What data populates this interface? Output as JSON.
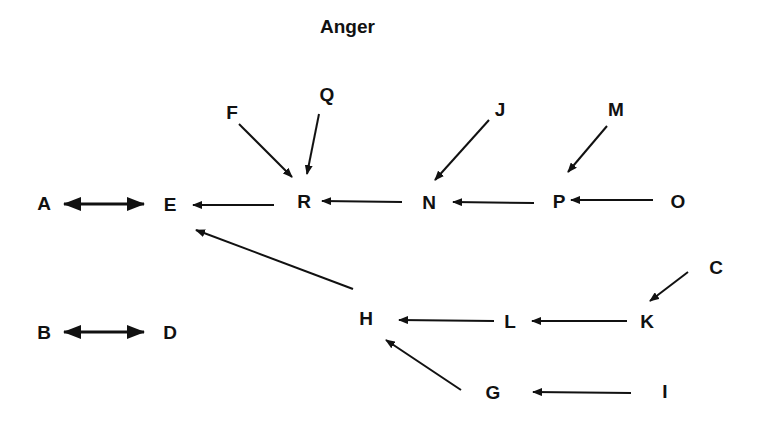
{
  "diagram": {
    "title": "Anger",
    "nodes": [
      {
        "id": "A",
        "label": "A",
        "x": 44,
        "y": 203
      },
      {
        "id": "E",
        "label": "E",
        "x": 170,
        "y": 204
      },
      {
        "id": "F",
        "label": "F",
        "x": 232,
        "y": 112
      },
      {
        "id": "Q",
        "label": "Q",
        "x": 327,
        "y": 94
      },
      {
        "id": "R",
        "label": "R",
        "x": 304,
        "y": 201
      },
      {
        "id": "J",
        "label": "J",
        "x": 500,
        "y": 109
      },
      {
        "id": "N",
        "label": "N",
        "x": 429,
        "y": 202
      },
      {
        "id": "M",
        "label": "M",
        "x": 616,
        "y": 109
      },
      {
        "id": "P",
        "label": "P",
        "x": 559,
        "y": 201
      },
      {
        "id": "O",
        "label": "O",
        "x": 678,
        "y": 201
      },
      {
        "id": "C",
        "label": "C",
        "x": 716,
        "y": 267
      },
      {
        "id": "H",
        "label": "H",
        "x": 366,
        "y": 318
      },
      {
        "id": "L",
        "label": "L",
        "x": 510,
        "y": 321
      },
      {
        "id": "K",
        "label": "K",
        "x": 647,
        "y": 321
      },
      {
        "id": "B",
        "label": "B",
        "x": 44,
        "y": 332
      },
      {
        "id": "D",
        "label": "D",
        "x": 170,
        "y": 332
      },
      {
        "id": "G",
        "label": "G",
        "x": 493,
        "y": 392
      },
      {
        "id": "I",
        "label": "I",
        "x": 665,
        "y": 391
      }
    ],
    "edges": [
      {
        "from": "A",
        "to": "E",
        "type": "bidirectional",
        "x1": 64,
        "y1": 204,
        "x2": 144,
        "y2": 204
      },
      {
        "from": "B",
        "to": "D",
        "type": "bidirectional",
        "x1": 64,
        "y1": 332,
        "x2": 144,
        "y2": 332
      },
      {
        "from": "R",
        "to": "E",
        "type": "directed",
        "x1": 274,
        "y1": 205,
        "x2": 193,
        "y2": 205
      },
      {
        "from": "F",
        "to": "R",
        "type": "directed",
        "x1": 239,
        "y1": 124,
        "x2": 292,
        "y2": 177
      },
      {
        "from": "Q",
        "to": "R",
        "type": "directed",
        "x1": 319,
        "y1": 114,
        "x2": 307,
        "y2": 174
      },
      {
        "from": "N",
        "to": "R",
        "type": "directed",
        "x1": 402,
        "y1": 202,
        "x2": 322,
        "y2": 201
      },
      {
        "from": "J",
        "to": "N",
        "type": "directed",
        "x1": 489,
        "y1": 120,
        "x2": 435,
        "y2": 180
      },
      {
        "from": "P",
        "to": "N",
        "type": "directed",
        "x1": 534,
        "y1": 203,
        "x2": 453,
        "y2": 202
      },
      {
        "from": "M",
        "to": "P",
        "type": "directed",
        "x1": 607,
        "y1": 126,
        "x2": 568,
        "y2": 172
      },
      {
        "from": "O",
        "to": "P",
        "type": "directed",
        "x1": 653,
        "y1": 200,
        "x2": 571,
        "y2": 200
      },
      {
        "from": "H",
        "to": "E",
        "type": "directed",
        "x1": 353,
        "y1": 289,
        "x2": 196,
        "y2": 230
      },
      {
        "from": "L",
        "to": "H",
        "type": "directed",
        "x1": 494,
        "y1": 321,
        "x2": 399,
        "y2": 320
      },
      {
        "from": "K",
        "to": "L",
        "type": "directed",
        "x1": 627,
        "y1": 321,
        "x2": 532,
        "y2": 321
      },
      {
        "from": "C",
        "to": "K",
        "type": "directed",
        "x1": 688,
        "y1": 272,
        "x2": 650,
        "y2": 301
      },
      {
        "from": "G",
        "to": "H",
        "type": "directed",
        "x1": 461,
        "y1": 390,
        "x2": 386,
        "y2": 340
      },
      {
        "from": "I",
        "to": "G",
        "type": "directed",
        "x1": 631,
        "y1": 393,
        "x2": 533,
        "y2": 392
      }
    ]
  }
}
